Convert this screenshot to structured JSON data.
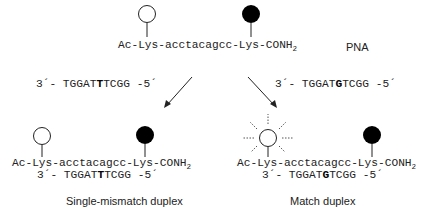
{
  "top": {
    "pna_sequence": {
      "prefix": "Ac-Lys-acctacagcc-Lys-CONH",
      "subscript": "2"
    },
    "label": "PNA",
    "donor_marker": "open-circle",
    "quencher_marker": "filled-circle"
  },
  "targets": {
    "mismatch": {
      "pre": "3´- TGGAT",
      "highlight": "T",
      "post": "TCGG -5´"
    },
    "match": {
      "pre": "3´- TGGAT",
      "highlight": "G",
      "post": "TCGG -5´"
    }
  },
  "bottom_left": {
    "pna_sequence": {
      "prefix": "Ac-Lys-acctacagcc-Lys-CONH",
      "subscript": "2"
    },
    "dna": {
      "pre": "3´- TGGAT",
      "highlight": "T",
      "post": "TCGG -5´"
    },
    "caption": "Single-mismatch duplex"
  },
  "bottom_right": {
    "pna_sequence": {
      "prefix": "Ac-Lys-acctacagcc-Lys-CONH",
      "subscript": "2"
    },
    "dna": {
      "pre": "3´- TGGAT",
      "highlight": "G",
      "post": "TCGG -5´"
    },
    "caption": "Match duplex",
    "fluorescence_marker": "glowing-open-circle"
  }
}
